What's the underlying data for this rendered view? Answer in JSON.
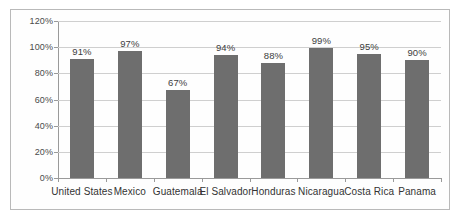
{
  "chart_data": {
    "type": "bar",
    "title": "",
    "xlabel": "",
    "ylabel": "",
    "categories": [
      "United States",
      "Mexico",
      "Guatemala",
      "El Salvador",
      "Honduras",
      "Nicaragua",
      "Costa Rica",
      "Panama"
    ],
    "values": [
      91,
      97,
      67,
      94,
      88,
      99,
      95,
      90
    ],
    "data_labels": [
      "91%",
      "97%",
      "67%",
      "94%",
      "88%",
      "99%",
      "95%",
      "90%"
    ],
    "ylim": [
      0,
      120
    ],
    "ytick_values": [
      0,
      20,
      40,
      60,
      80,
      100,
      120
    ],
    "ytick_labels": [
      "0%",
      "20%",
      "40%",
      "60%",
      "80%",
      "100%",
      "120%"
    ],
    "grid": true,
    "legend": "none",
    "bar_color": "#6e6e6e",
    "gridline_color": "#cfcfcf",
    "axis_color": "#9a9a9a",
    "border_color": "#b9b9b9",
    "background_color": "#fefefe"
  }
}
